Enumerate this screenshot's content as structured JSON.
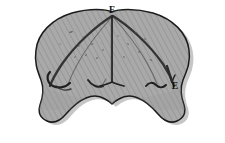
{
  "figure": {
    "kind": "anatomical-line-drawing",
    "background_color": "#ffffff",
    "body_fill_color": "#a9a9a9",
    "hatch_line_color": "#8f8f8f",
    "outline_color": "#1a1a1a",
    "shadow_color": "#b9b9b9",
    "speckle_color": "#4a4a4a",
    "label_color": "#111111",
    "labels": [
      {
        "id": "label-f",
        "text": "F",
        "x": 112,
        "y": 13,
        "role": "apex-point-label"
      },
      {
        "id": "label-e",
        "text": "E",
        "x": 175,
        "y": 89,
        "role": "lower-right-point-label"
      }
    ],
    "annotations": {
      "arc_count": 4,
      "central_stem": "vertical line from F to lower center",
      "hook_marks": 4,
      "lobes": 2
    }
  }
}
